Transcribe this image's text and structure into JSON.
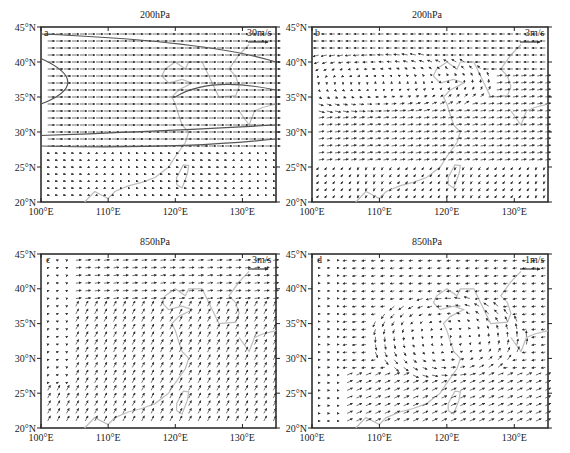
{
  "chart_data": [
    {
      "panel": "a",
      "type": "vector",
      "title": "200hPa",
      "reference_vector": "30m/s",
      "x_ticks": [
        "100°E",
        "110°E",
        "120°E",
        "130°E"
      ],
      "y_ticks": [
        "45°N",
        "40°N",
        "35°N",
        "30°N",
        "25°N",
        "20°N"
      ],
      "xlim": [
        100,
        135
      ],
      "ylim": [
        20,
        45
      ],
      "description": "Strong westerly jet from ~28°N to 45°N with contour lines of wind speed; weak flow south of 27°N",
      "contour_labels": [
        "40",
        "28"
      ]
    },
    {
      "panel": "b",
      "type": "vector",
      "title": "200hPa",
      "reference_vector": "3m/s",
      "x_ticks": [
        "100°E",
        "110°E",
        "120°E",
        "130°E"
      ],
      "y_ticks": [
        "45°N",
        "40°N",
        "35°N",
        "30°N",
        "25°N",
        "20°N"
      ],
      "xlim": [
        100,
        135
      ],
      "ylim": [
        20,
        45
      ],
      "description": "Anticyclonic / cyclonic anomaly circulation centered near 37°N, 110°E; easterlies north of 40°N, westerlies 28-35°N, northeasterlies south of 25°N"
    },
    {
      "panel": "c",
      "type": "vector",
      "title": "850hPa",
      "reference_vector": "3m/s",
      "x_ticks": [
        "100°E",
        "110°E",
        "120°E",
        "130°E"
      ],
      "y_ticks": [
        "45°N",
        "40°N",
        "35°N",
        "30°N",
        "25°N",
        "20°N"
      ],
      "xlim": [
        100,
        135
      ],
      "ylim": [
        20,
        45
      ],
      "description": "Southwesterly monsoon flow over southern China turning to northeastward flow over East China Sea and Japan"
    },
    {
      "panel": "d",
      "type": "vector",
      "title": "850hPa",
      "reference_vector": "1m/s",
      "x_ticks": [
        "100°E",
        "110°E",
        "120°E",
        "130°E"
      ],
      "y_ticks": [
        "45°N",
        "40°N",
        "35°N",
        "30°N",
        "25°N",
        "20°N"
      ],
      "xlim": [
        100,
        135
      ],
      "ylim": [
        20,
        45
      ],
      "description": "Cyclonic anomaly centered near 33°N, 122°E with strong southwesterlies from 22-28°N"
    }
  ],
  "panels": {
    "a": {
      "label": "a",
      "title": "200hPa",
      "ref": "30m/s"
    },
    "b": {
      "label": "b",
      "title": "200hPa",
      "ref": "3m/s"
    },
    "c": {
      "label": "c",
      "title": "850hPa",
      "ref": "3m/s"
    },
    "d": {
      "label": "d",
      "title": "850hPa",
      "ref": "1m/s"
    }
  },
  "axes": {
    "x_ticks": [
      "100°E",
      "110°E",
      "120°E",
      "130°E"
    ],
    "y_ticks": [
      "45°N",
      "40°N",
      "35°N",
      "30°N",
      "25°N",
      "20°N"
    ]
  },
  "colors": {
    "vector": "#333333",
    "coast": "#bdbdbd",
    "contour": "#555555",
    "axis": "#222222"
  }
}
